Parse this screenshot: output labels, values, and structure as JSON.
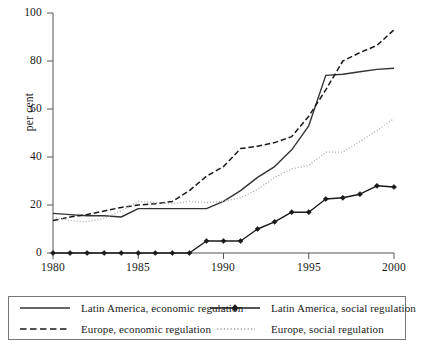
{
  "chart": {
    "type": "line",
    "ylabel": "per cent",
    "xlabel": "",
    "title": "",
    "grid": false,
    "xlim": [
      1980,
      2000
    ],
    "ylim": [
      0,
      100
    ],
    "yticks": [
      0,
      20,
      40,
      60,
      80,
      100
    ],
    "xticks": [
      1980,
      1985,
      1990,
      1995,
      2000
    ],
    "ytick_labels": [
      "0",
      "20",
      "40",
      "60",
      "80",
      "100"
    ],
    "xtick_labels": [
      "1980",
      "1985",
      "1990",
      "1995",
      "2000"
    ],
    "legend_position": "below-plot",
    "series": [
      {
        "name": "Latin America, economic regulation",
        "style": "solid",
        "color": "#333333",
        "marker": "none",
        "x": [
          1980,
          1981,
          1982,
          1983,
          1984,
          1985,
          1986,
          1987,
          1988,
          1989,
          1990,
          1991,
          1992,
          1993,
          1994,
          1995,
          1996,
          1997,
          1998,
          1999,
          2000
        ],
        "values": [
          16.5,
          16.0,
          15.5,
          15.5,
          15.0,
          18.5,
          18.5,
          18.5,
          18.5,
          18.5,
          21.5,
          26.0,
          31.5,
          36.0,
          43.0,
          53.0,
          74.0,
          74.5,
          75.5,
          76.5,
          77.0
        ]
      },
      {
        "name": "Europe, economic regulation",
        "style": "dashed",
        "color": "#1a1a1a",
        "marker": "none",
        "x": [
          1980,
          1981,
          1982,
          1983,
          1984,
          1985,
          1986,
          1987,
          1988,
          1989,
          1990,
          1991,
          1992,
          1993,
          1994,
          1995,
          1996,
          1997,
          1998,
          1999,
          2000
        ],
        "values": [
          13.5,
          15.0,
          16.0,
          17.5,
          19.0,
          20.0,
          20.5,
          21.5,
          26.0,
          32.0,
          36.0,
          43.5,
          44.5,
          46.0,
          48.5,
          57.0,
          68.0,
          80.0,
          83.5,
          86.5,
          93.0
        ]
      },
      {
        "name": "Latin America, social regulation",
        "style": "solid-marker",
        "color": "#1a1a1a",
        "marker": "diamond",
        "x": [
          1980,
          1981,
          1982,
          1983,
          1984,
          1985,
          1986,
          1987,
          1988,
          1989,
          1990,
          1991,
          1992,
          1993,
          1994,
          1995,
          1996,
          1997,
          1998,
          1999,
          2000
        ],
        "values": [
          0,
          0,
          0,
          0,
          0,
          0,
          0,
          0,
          0,
          5.0,
          5.0,
          5.0,
          10.0,
          13.0,
          17.0,
          17.0,
          22.5,
          23.0,
          24.5,
          28.0,
          27.5
        ]
      },
      {
        "name": "Europe, social regulation",
        "style": "dotted",
        "color": "#b0b0b0",
        "marker": "none",
        "x": [
          1980,
          1981,
          1982,
          1983,
          1984,
          1985,
          1986,
          1987,
          1988,
          1989,
          1990,
          1991,
          1992,
          1993,
          1994,
          1995,
          1996,
          1997,
          1998,
          1999,
          2000
        ],
        "values": [
          15.0,
          13.5,
          13.0,
          14.5,
          17.5,
          21.5,
          21.0,
          20.5,
          21.5,
          21.0,
          21.5,
          23.0,
          26.5,
          31.5,
          35.0,
          36.5,
          42.0,
          42.0,
          46.5,
          51.0,
          56.0
        ]
      }
    ]
  },
  "legend": {
    "entries": [
      {
        "label": "Latin America, economic regulation",
        "swatch": "solid-line-swatch"
      },
      {
        "label": "Latin America, social regulation",
        "swatch": "solid-marker-line-swatch"
      },
      {
        "label": "Europe, economic regulation",
        "swatch": "dashed-line-swatch"
      },
      {
        "label": "Europe, social regulation",
        "swatch": "dotted-line-swatch"
      }
    ]
  },
  "colors": {
    "axis": "#555555",
    "latin_economic": "#333333",
    "europe_economic": "#1a1a1a",
    "latin_social": "#1a1a1a",
    "europe_social": "#b0b0b0",
    "legend_border": "#777777"
  }
}
